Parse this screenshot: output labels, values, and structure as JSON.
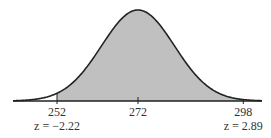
{
  "chart_data": {
    "type": "area",
    "title": "",
    "xlabel": "",
    "ylabel": "",
    "distribution": "normal",
    "mean": 272,
    "sd": 9,
    "shaded_range": [
      252,
      298
    ],
    "shade_color": "#c0c0c0",
    "xlim": [
      241,
      302
    ],
    "ticks": [
      {
        "value": 252,
        "label": "252",
        "z_label": "z = −2.22"
      },
      {
        "value": 272,
        "label": "272",
        "z_label": ""
      },
      {
        "value": 298,
        "label": "298",
        "z_label": "z = 2.89"
      }
    ]
  }
}
